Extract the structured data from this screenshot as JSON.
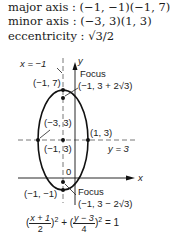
{
  "properties": {
    "major_axis_label": "major axis : ",
    "major_axis_value": "(−1, −1)(−1, 7)",
    "minor_axis_label": "minor axis : ",
    "minor_axis_value": "(−3, 3)(1, 3)",
    "eccentricity_label": "eccentricity : ",
    "eccentricity_value": "√3/2"
  },
  "diagram": {
    "directrix_label": "x = −1",
    "y_axis_label": "y",
    "x_axis_label": "x",
    "origin_label": "0",
    "horizontal_line_label": "y = 3",
    "top_vertex_label": "(−1, 7)",
    "bottom_vertex_label": "(−1, −1)",
    "left_vertex_label": "(−3, 3)",
    "right_vertex_label": "(1, 3)",
    "center_label": "(−1, 3)",
    "focus_top_title": "Focus",
    "focus_top_coords": "(−1, 3 + 2√3)",
    "focus_bottom_title": "Focus",
    "focus_bottom_coords": "(−1, 3 − 2√3)",
    "colors": {
      "stroke": "#111111",
      "dashed": "#555555"
    }
  },
  "equation": {
    "lparen1": "(",
    "num1": "x + 1",
    "den1": "2",
    "rparen1": ")",
    "exp1": "2",
    "plus": " + ",
    "lparen2": "(",
    "num2": "y − 3",
    "den2": "4",
    "rparen2": ")",
    "exp2": "2",
    "equals": " = 1"
  }
}
